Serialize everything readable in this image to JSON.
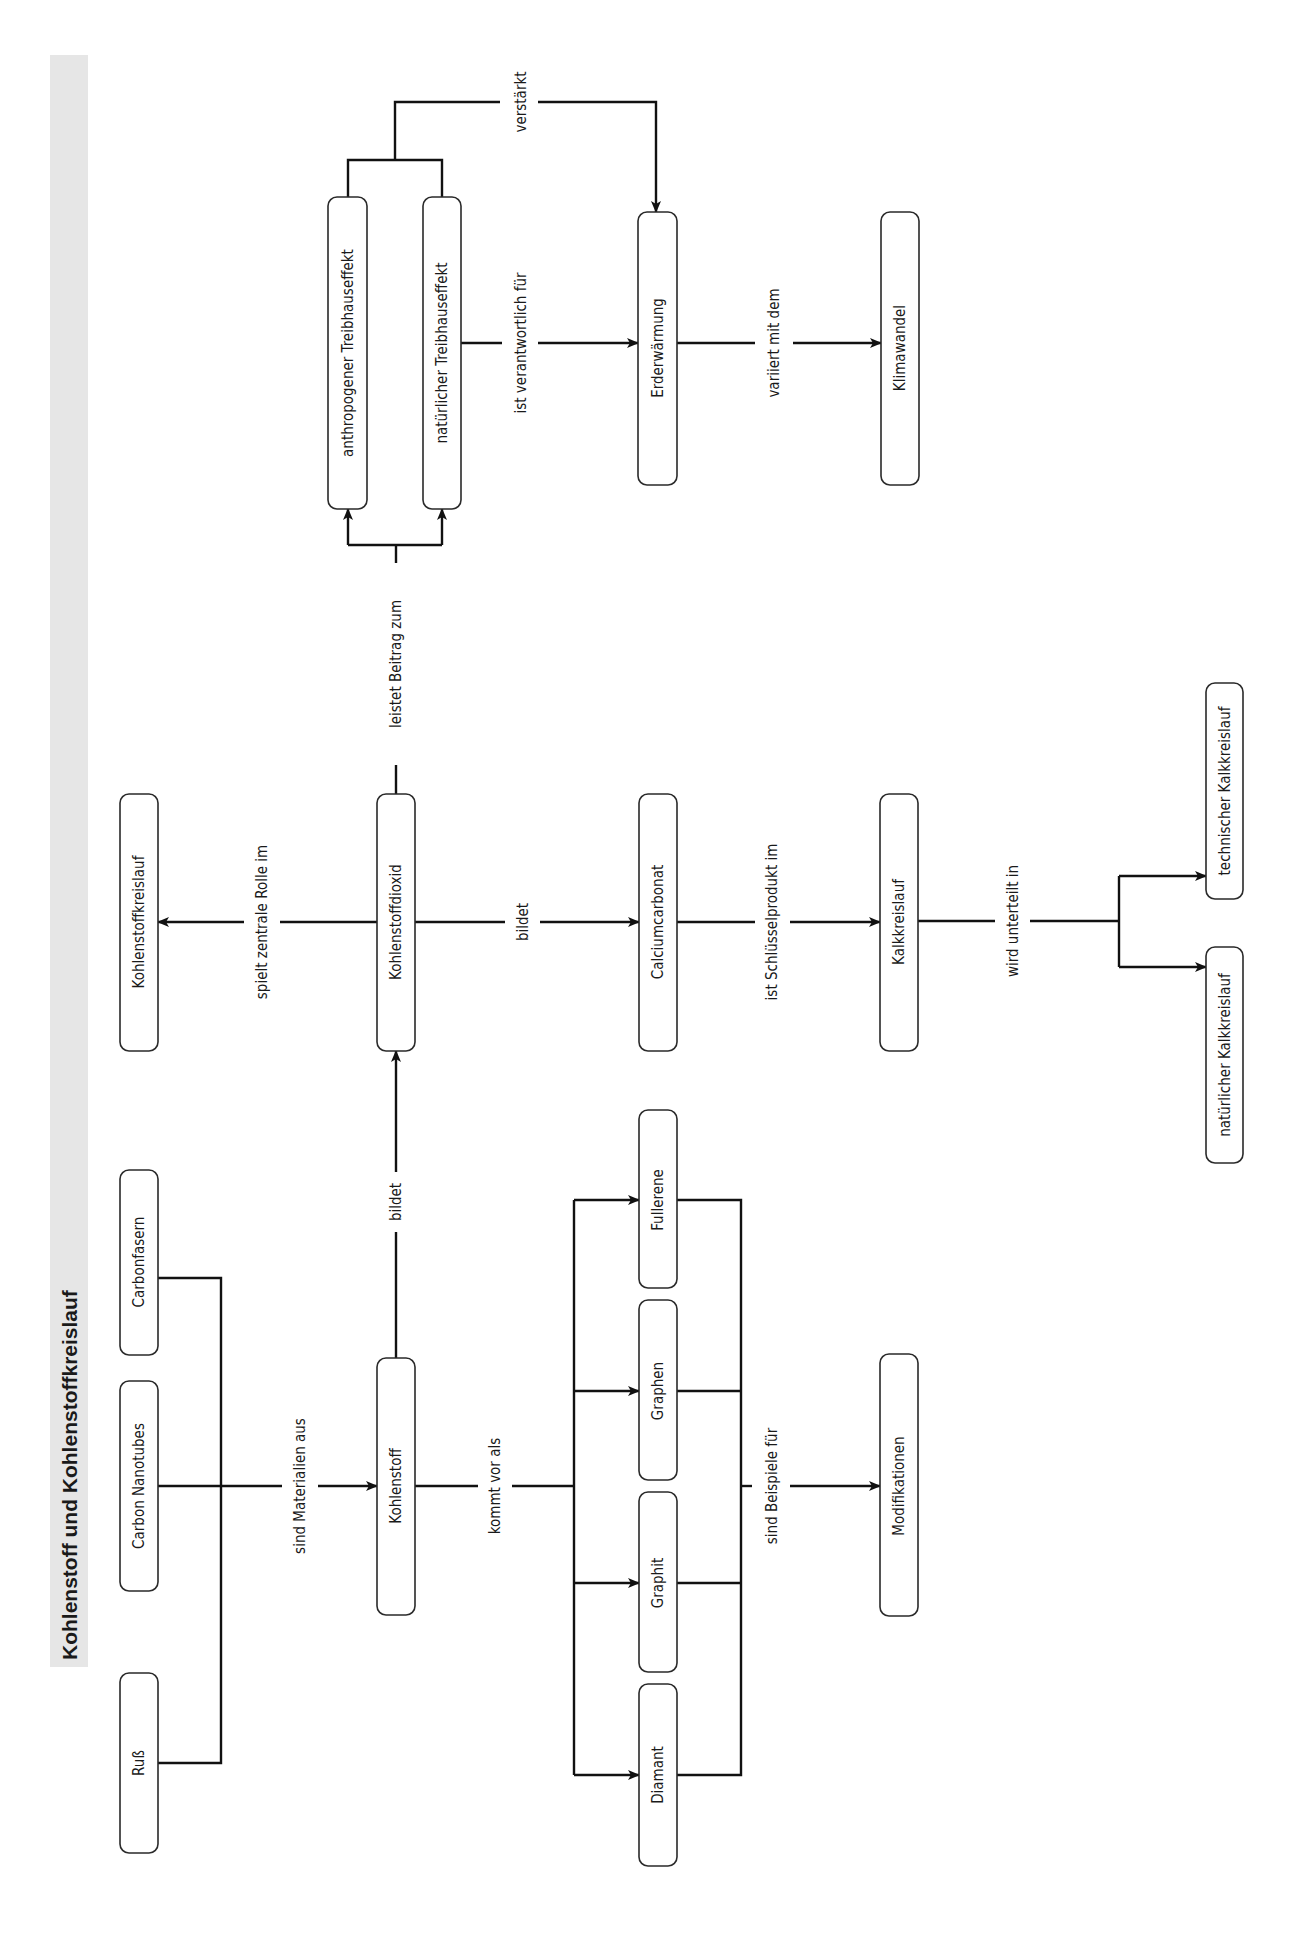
{
  "title": "Kohlenstoff und Kohlenstoffkreislauf",
  "nodes": {
    "russ": "Ruß",
    "carbon_nanotubes": "Carbon Nanotubes",
    "carbonfasern": "Carbonfasern",
    "kohlenstoffkreislauf": "Kohlenstoffkreislauf",
    "kohlenstoff": "Kohlenstoff",
    "kohlenstoffdioxid": "Kohlenstoffdioxid",
    "diamant": "Diamant",
    "graphit": "Graphit",
    "graphen": "Graphen",
    "fullerene": "Fullerene",
    "calciumcarbonat": "Calciumcarbonat",
    "modifikationen": "Modifikationen",
    "kalkkreislauf": "Kalkkreislauf",
    "natuerlicher_kalkkreislauf": "natürlicher Kalkkreislauf",
    "technischer_kalkkreislauf": "technischer Kalkkreislauf",
    "anthropogener_treibhauseffekt": "anthropogener Treibhauseffekt",
    "natuerlicher_treibhauseffekt": "natürlicher Treibhauseffekt",
    "erderwaermung": "Erderwärmung",
    "klimawandel": "Klimawandel"
  },
  "edges": {
    "sind_materialien_aus": "sind Materialien aus",
    "bildet_co2": "bildet",
    "spielt_zentrale_rolle": "spielt zentrale Rolle im",
    "leistet_beitrag": "leistet Beitrag zum",
    "kommt_vor_als": "kommt vor als",
    "bildet_caco3": "bildet",
    "sind_beispiele_fuer": "sind Beispiele für",
    "ist_schluesselprodukt": "ist Schlüsselprodukt im",
    "wird_unterteilt_in": "wird unterteilt in",
    "ist_verantwortlich_fuer": "ist verantwortlich für",
    "verstaerkt": "verstärkt",
    "variiert_mit_dem": "variiert mit dem"
  }
}
